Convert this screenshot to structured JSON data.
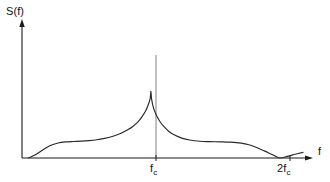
{
  "figure": {
    "background_color": "#ffffff",
    "line_color": "#2a2a2a",
    "reference_line_color": "#6b6b6b",
    "y_axis_label": "S(f)",
    "x_axis_label": "f",
    "tick_labels": {
      "center": {
        "base": "f",
        "sub": "c"
      },
      "double": {
        "prefix": "2",
        "base": "f",
        "sub": "c"
      }
    }
  },
  "chart_data": {
    "type": "line",
    "title": "",
    "xlabel": "f",
    "ylabel": "S(f)",
    "grid": false,
    "legend": null,
    "xlim": [
      0,
      2.25
    ],
    "ylim": [
      0,
      1.15
    ],
    "xticks": [
      1,
      2
    ],
    "xticklabels": [
      "f_c",
      "2f_c"
    ],
    "yticks": [],
    "yticklabels": [],
    "annotations": [
      {
        "text": "vertical reference line at f_c",
        "x": 1.0,
        "y_from": 0,
        "y_to": 1.12
      }
    ],
    "series": [
      {
        "name": "S(f)",
        "description": "Power spectral density with sharp cusp peak at the carrier frequency f_c, shoulder plateaus on both sides, and a null at 2f_c",
        "x": [
          0.05,
          0.1,
          0.16,
          0.22,
          0.28,
          0.34,
          0.4,
          0.46,
          0.52,
          0.58,
          0.64,
          0.7,
          0.76,
          0.82,
          0.86,
          0.9,
          0.93,
          0.96,
          0.98,
          0.995,
          1.0,
          1.005,
          1.02,
          1.04,
          1.07,
          1.1,
          1.14,
          1.18,
          1.24,
          1.3,
          1.38,
          1.46,
          1.54,
          1.62,
          1.7,
          1.76,
          1.82,
          1.88,
          1.94,
          2.0,
          2.06,
          2.12,
          2.18
        ],
        "y": [
          0.0,
          0.035,
          0.095,
          0.15,
          0.18,
          0.193,
          0.198,
          0.202,
          0.208,
          0.218,
          0.235,
          0.258,
          0.29,
          0.338,
          0.378,
          0.432,
          0.492,
          0.565,
          0.64,
          0.715,
          0.8,
          0.712,
          0.6,
          0.52,
          0.438,
          0.378,
          0.318,
          0.278,
          0.238,
          0.215,
          0.2,
          0.196,
          0.194,
          0.19,
          0.178,
          0.158,
          0.125,
          0.085,
          0.042,
          0.0,
          0.02,
          0.045,
          0.068
        ]
      }
    ]
  }
}
